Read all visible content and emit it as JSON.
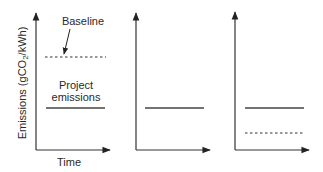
{
  "figure": {
    "y_axis_label": {
      "prefix": "Emissions (gCO",
      "subscript": "2",
      "suffix": "/kWh)"
    },
    "x_axis_label": "Time",
    "annotations": {
      "baseline": "Baseline",
      "project_line1": "Project",
      "project_line2": "emissions"
    },
    "colors": {
      "axis": "#333333",
      "line": "#333333",
      "text": "#2a2a2a"
    },
    "panels": [
      {
        "id": "panel-1",
        "lines": [
          {
            "name": "Baseline",
            "style": "dashed",
            "y_px": 57
          },
          {
            "name": "Project emissions",
            "style": "solid",
            "y_px": 108
          }
        ]
      },
      {
        "id": "panel-2",
        "lines": [
          {
            "name": "Project emissions",
            "style": "solid",
            "y_px": 108
          }
        ]
      },
      {
        "id": "panel-3",
        "lines": [
          {
            "name": "Project emissions",
            "style": "solid",
            "y_px": 108
          },
          {
            "name": "Baseline",
            "style": "dashed",
            "y_px": 133
          }
        ]
      }
    ]
  }
}
